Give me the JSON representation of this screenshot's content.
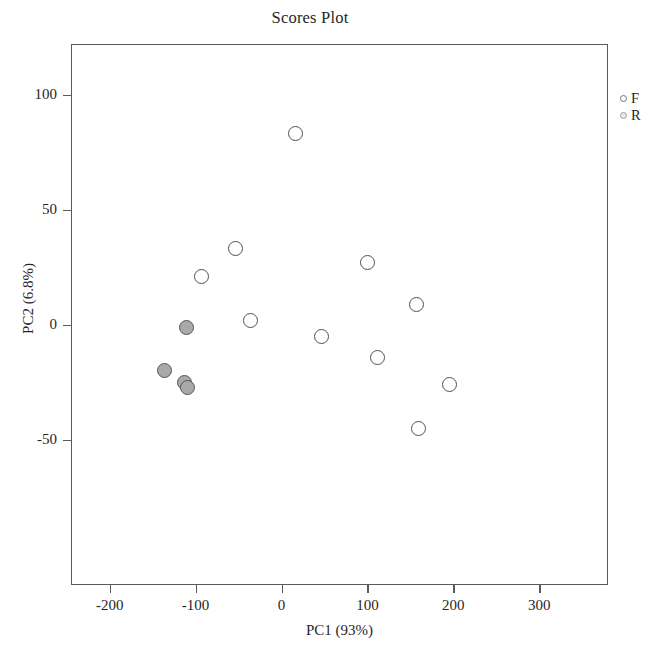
{
  "chart_data": {
    "type": "scatter",
    "title": "Scores Plot",
    "xlabel": "PC1 (93%)",
    "ylabel": "PC2 (6.8%)",
    "xlim": [
      -245,
      380
    ],
    "ylim": [
      -113,
      122
    ],
    "xticks": [
      -200,
      -100,
      0,
      100,
      200,
      300
    ],
    "xticklabels": [
      "-200",
      "-100",
      "0",
      "100",
      "200",
      "300"
    ],
    "yticks": [
      100,
      50,
      0,
      -50
    ],
    "yticklabels": [
      "100",
      "50",
      "0",
      "-50"
    ],
    "grid": false,
    "legend_position": "right-outside",
    "series": [
      {
        "name": "F",
        "marker": "open-circle",
        "color": "#4d5156",
        "fill": "#ffffff",
        "points": [
          {
            "x": 16,
            "y": 83
          },
          {
            "x": -53,
            "y": 33
          },
          {
            "x": -93,
            "y": 21
          },
          {
            "x": 100,
            "y": 27
          },
          {
            "x": -36,
            "y": 2
          },
          {
            "x": 157,
            "y": 9
          },
          {
            "x": 47,
            "y": -5
          },
          {
            "x": 112,
            "y": -14
          },
          {
            "x": 195,
            "y": -26
          },
          {
            "x": 160,
            "y": -45
          }
        ]
      },
      {
        "name": "R",
        "marker": "filled-circle",
        "color": "#53575b",
        "fill": "#a9a9a9",
        "points": [
          {
            "x": -110,
            "y": -1
          },
          {
            "x": -136,
            "y": -20
          },
          {
            "x": -113,
            "y": -25
          },
          {
            "x": -109,
            "y": -27
          }
        ]
      }
    ]
  },
  "legend": {
    "entries": [
      {
        "label": "F",
        "marker": "open-circle"
      },
      {
        "label": "R",
        "marker": "filled-circle"
      }
    ]
  }
}
